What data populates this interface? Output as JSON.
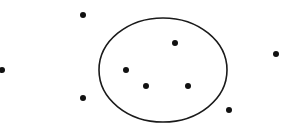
{
  "diagram": {
    "title": "",
    "width": 293,
    "height": 133,
    "colors": {
      "background": "#ffffff",
      "stroke": "#1a1a1a",
      "dot": "#111111"
    },
    "ellipse": {
      "cx": 163,
      "cy": 70,
      "rx": 64,
      "ry": 52,
      "stroke_width": 1.6
    },
    "dot_radius": 3,
    "points_inside": [
      {
        "x": 175,
        "y": 43
      },
      {
        "x": 126,
        "y": 70
      },
      {
        "x": 146,
        "y": 86
      },
      {
        "x": 188,
        "y": 86
      }
    ],
    "points_outside": [
      {
        "x": 83,
        "y": 15
      },
      {
        "x": 276,
        "y": 54
      },
      {
        "x": 2,
        "y": 70
      },
      {
        "x": 83,
        "y": 98
      },
      {
        "x": 229,
        "y": 110
      }
    ]
  }
}
